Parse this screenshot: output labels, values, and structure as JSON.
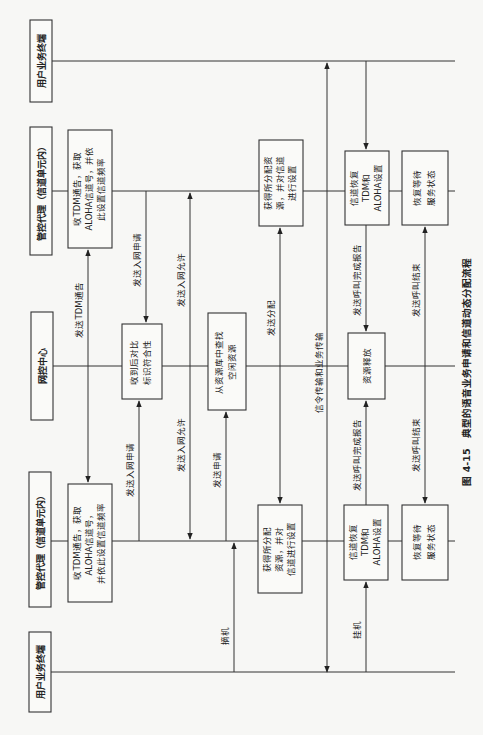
{
  "diagram": {
    "caption": "图 4-15　典型的语音业务申请和信道动态分配流程",
    "orientation": "rotated-90-ccw",
    "actors": [
      {
        "id": "user_terminal_1",
        "label": "用户业务终端"
      },
      {
        "id": "control_agent_1",
        "label": "管控代理（信道单元内）"
      },
      {
        "id": "network_center",
        "label": "网控中心"
      },
      {
        "id": "control_agent_2",
        "label": "管控代理（信道单元内）"
      },
      {
        "id": "user_terminal_2",
        "label": "用户业务终端"
      }
    ],
    "process_boxes": {
      "ca2_recv_tdm": [
        "收TDM通告，获取",
        "ALOHA信道号，并依",
        "此设置信道频率"
      ],
      "ca1_recv_tdm": [
        "收TDM通告，获取",
        "ALOHA信道号，",
        "并依此设置信道频率"
      ],
      "nc_verify": [
        "收到后对比",
        "标识符合性"
      ],
      "nc_find": [
        "从资源库中查找",
        "空闲资源"
      ],
      "ca2_get_alloc": [
        "获得所分配资",
        "源，并对信道",
        "进行设置"
      ],
      "ca1_get_alloc": [
        "获得所分配",
        "资源，并对",
        "信道进行设置"
      ],
      "nc_release": [
        "资源释放"
      ],
      "ca2_restore_ch": [
        "信道恢复",
        "TDM和",
        "ALOHA设置"
      ],
      "ca1_restore_ch": [
        "信道恢复",
        "TDM和",
        "ALOHA设置"
      ],
      "ca2_restore_wait": [
        "恢复等待",
        "服务状态"
      ],
      "ca1_restore_wait": [
        "恢复等待",
        "服务状态"
      ]
    },
    "messages": {
      "tdm_announce": "发送TDM通告",
      "join_request_2": "发送入网申请",
      "join_request_1": "发送入网申请",
      "join_permit_2": "发送入网允许",
      "join_permit_1": "发送入网允许",
      "send_apply": "发送申请",
      "off_hook": "摘机",
      "send_alloc": "发送分配",
      "signaling": "信令传输和业务传输",
      "call_complete_2": "发送呼叫完成报告",
      "call_complete_1": "发送呼叫完成报告",
      "on_hook": "挂机",
      "call_end_2": "发送呼叫结束",
      "call_end_1": "发送呼叫结束"
    }
  }
}
